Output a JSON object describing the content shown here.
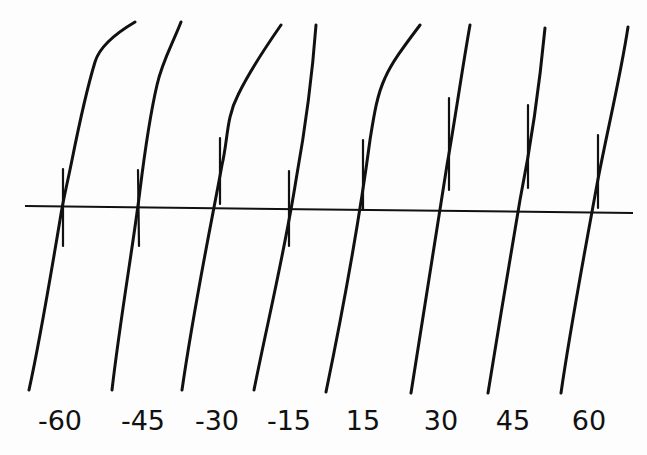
{
  "diagram": {
    "type": "line-drawing",
    "colors": {
      "ink": "#111111",
      "background": "#fdfdfd"
    },
    "baseline": {
      "x1": 25,
      "y1": 206,
      "x2": 633,
      "y2": 213
    },
    "curves": [
      {
        "label": "-60",
        "label_x": 60,
        "path": "M135,22 C118,32 100,45 95,62 C85,95 78,130 72,160 C67,185 63,200 60,220 C50,280 40,340 29,390",
        "tick": {
          "x1": 63,
          "y1": 169,
          "x2": 63,
          "y2": 246
        }
      },
      {
        "label": "-45",
        "label_x": 143,
        "path": "M181,22 C172,45 162,62 157,85 C150,115 145,150 140,190 C134,240 120,320 112,390",
        "tick": {
          "x1": 138,
          "y1": 170,
          "x2": 139,
          "y2": 246
        }
      },
      {
        "label": "-30",
        "label_x": 217,
        "path": "M281,25 C265,48 250,70 238,95 C226,118 228,140 222,165 C212,220 195,300 182,390",
        "tick": {
          "x1": 220,
          "y1": 138,
          "x2": 220,
          "y2": 204
        }
      },
      {
        "label": "-15",
        "label_x": 289,
        "path": "M316,25 C312,80 305,130 296,180 C285,250 268,320 254,390",
        "tick": {
          "x1": 289,
          "y1": 171,
          "x2": 289,
          "y2": 246
        }
      },
      {
        "label": "15",
        "label_x": 363,
        "path": "M420,25 C405,45 392,62 385,78 C377,95 374,115 370,140 C362,200 345,300 326,392",
        "tick": {
          "x1": 363,
          "y1": 140,
          "x2": 363,
          "y2": 210
        }
      },
      {
        "label": "30",
        "label_x": 441,
        "path": "M470,25 C462,70 455,120 447,165 C437,230 424,310 411,393",
        "tick": {
          "x1": 449,
          "y1": 98,
          "x2": 449,
          "y2": 190
        }
      },
      {
        "label": "45",
        "label_x": 513,
        "path": "M545,28 C540,80 530,150 520,200 C510,260 498,330 488,393",
        "tick": {
          "x1": 528,
          "y1": 105,
          "x2": 528,
          "y2": 188
        }
      },
      {
        "label": "60",
        "label_x": 589,
        "path": "M628,27 C620,80 605,140 596,190 C585,250 570,330 561,393",
        "tick": {
          "x1": 598,
          "y1": 135,
          "x2": 598,
          "y2": 208
        }
      }
    ],
    "labels": [
      "-60",
      "-45",
      "-30",
      "-15",
      "15",
      "30",
      "45",
      "60"
    ]
  }
}
